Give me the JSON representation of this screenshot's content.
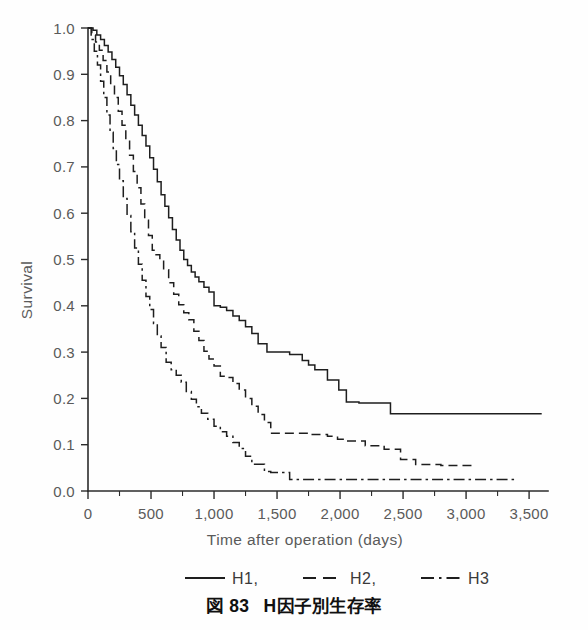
{
  "figure": {
    "caption_number": "図 83",
    "caption_text": "H因子別生存率"
  },
  "axes": {
    "ylabel": "Survival",
    "xlabel": "Time after operation (days)",
    "y_ticks": [
      "0.0",
      "0.1",
      "0.2",
      "0.3",
      "0.4",
      "0.5",
      "0.6",
      "0.7",
      "0.8",
      "0.9",
      "1.0"
    ],
    "x_ticks": [
      "0",
      "500",
      "1,000",
      "1,500",
      "2,000",
      "2,500",
      "3,000",
      "3,500"
    ]
  },
  "legend": {
    "items": [
      {
        "label": "H1,",
        "style": "solid"
      },
      {
        "label": "H2,",
        "style": "dashed"
      },
      {
        "label": "H3",
        "style": "dash-dot"
      }
    ]
  },
  "chart_data": {
    "type": "line",
    "subtype": "kaplan-meier-step",
    "title": "H因子別生存率",
    "xlabel": "Time after operation (days)",
    "ylabel": "Survival",
    "xlim": [
      0,
      3650
    ],
    "ylim": [
      0.0,
      1.0
    ],
    "x_tick_values": [
      0,
      500,
      1000,
      1500,
      2000,
      2500,
      3000,
      3500
    ],
    "y_tick_values": [
      0.0,
      0.1,
      0.2,
      0.3,
      0.4,
      0.5,
      0.6,
      0.7,
      0.8,
      0.9,
      1.0
    ],
    "x_minor_tick_interval": 250,
    "grid": false,
    "legend_position": "below-axis",
    "series": [
      {
        "name": "H1",
        "style": "solid",
        "color": "#1e1e1e",
        "x": [
          0,
          40,
          70,
          100,
          130,
          160,
          190,
          220,
          250,
          280,
          310,
          340,
          370,
          400,
          430,
          460,
          490,
          520,
          550,
          580,
          610,
          640,
          670,
          700,
          730,
          760,
          790,
          820,
          850,
          880,
          920,
          960,
          1000,
          1050,
          1100,
          1150,
          1200,
          1250,
          1300,
          1350,
          1420,
          1500,
          1600,
          1700,
          1750,
          1800,
          1900,
          1990,
          2050,
          2150,
          2250,
          2380,
          2400,
          2800,
          3200,
          3600
        ],
        "y": [
          1.0,
          0.995,
          0.985,
          0.975,
          0.962,
          0.948,
          0.932,
          0.915,
          0.897,
          0.878,
          0.856,
          0.833,
          0.812,
          0.79,
          0.768,
          0.745,
          0.72,
          0.695,
          0.668,
          0.64,
          0.615,
          0.59,
          0.565,
          0.542,
          0.52,
          0.5,
          0.487,
          0.473,
          0.462,
          0.452,
          0.44,
          0.43,
          0.4,
          0.397,
          0.39,
          0.378,
          0.368,
          0.355,
          0.34,
          0.318,
          0.3,
          0.3,
          0.295,
          0.282,
          0.272,
          0.262,
          0.24,
          0.218,
          0.192,
          0.19,
          0.19,
          0.19,
          0.167,
          0.167,
          0.167,
          0.167
        ]
      },
      {
        "name": "H2",
        "style": "dashed",
        "color": "#1e1e1e",
        "x": [
          0,
          30,
          60,
          90,
          120,
          150,
          180,
          210,
          240,
          270,
          300,
          330,
          360,
          390,
          420,
          450,
          480,
          510,
          540,
          570,
          600,
          640,
          680,
          720,
          760,
          800,
          840,
          880,
          920,
          960,
          1000,
          1050,
          1100,
          1150,
          1200,
          1250,
          1300,
          1350,
          1400,
          1450,
          1600,
          1750,
          1900,
          1980,
          2050,
          2200,
          2350,
          2400,
          2480,
          2600,
          2800,
          3000,
          3050
        ],
        "y": [
          1.0,
          0.985,
          0.97,
          0.952,
          0.93,
          0.905,
          0.878,
          0.85,
          0.82,
          0.79,
          0.758,
          0.725,
          0.69,
          0.655,
          0.62,
          0.585,
          0.552,
          0.52,
          0.51,
          0.5,
          0.478,
          0.45,
          0.425,
          0.402,
          0.385,
          0.37,
          0.345,
          0.325,
          0.302,
          0.285,
          0.27,
          0.248,
          0.245,
          0.232,
          0.218,
          0.2,
          0.183,
          0.165,
          0.148,
          0.125,
          0.125,
          0.122,
          0.118,
          0.112,
          0.108,
          0.098,
          0.09,
          0.09,
          0.068,
          0.057,
          0.055,
          0.055,
          0.055
        ]
      },
      {
        "name": "H3",
        "style": "dash-dot",
        "color": "#1e1e1e",
        "x": [
          0,
          25,
          50,
          75,
          100,
          125,
          150,
          175,
          200,
          225,
          250,
          280,
          310,
          340,
          370,
          400,
          430,
          460,
          490,
          520,
          550,
          580,
          620,
          660,
          700,
          740,
          780,
          820,
          860,
          900,
          950,
          1000,
          1050,
          1100,
          1150,
          1200,
          1250,
          1300,
          1400,
          1450,
          1600,
          1800,
          2000,
          2200,
          2400,
          2600,
          2800,
          3000,
          3200,
          3350,
          3400
        ],
        "y": [
          1.0,
          0.975,
          0.95,
          0.92,
          0.885,
          0.85,
          0.812,
          0.775,
          0.74,
          0.705,
          0.67,
          0.632,
          0.595,
          0.56,
          0.525,
          0.49,
          0.455,
          0.42,
          0.392,
          0.362,
          0.335,
          0.31,
          0.278,
          0.262,
          0.25,
          0.235,
          0.215,
          0.198,
          0.182,
          0.168,
          0.155,
          0.14,
          0.128,
          0.118,
          0.105,
          0.092,
          0.075,
          0.058,
          0.042,
          0.04,
          0.025,
          0.025,
          0.025,
          0.025,
          0.025,
          0.025,
          0.025,
          0.025,
          0.025,
          0.025,
          0.022
        ]
      }
    ],
    "annotations": [
      "H1 plateaus at approximately 0.167 after ~2,400 days",
      "H2 plateaus at approximately 0.055 after ~3,000 days",
      "H3 plateaus at approximately 0.025 after ~1,500 days"
    ]
  }
}
